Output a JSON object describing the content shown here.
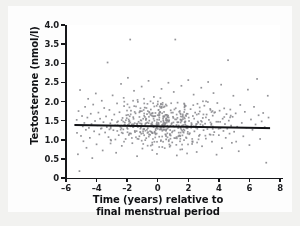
{
  "figure": {
    "background_color": "#f2f2f0",
    "panel_color": "#ffffff"
  },
  "chart_data": {
    "type": "scatter",
    "title": "",
    "xlabel_line1": "Time (years) relative to",
    "xlabel_line2": "final menstrual period",
    "xlabel": "Time (years) relative to final menstrual period",
    "ylabel": "Testosterone (nmol/l)",
    "xlim": [
      -6,
      8
    ],
    "ylim": [
      0,
      4.0
    ],
    "xticks": [
      -6,
      -4,
      -2,
      0,
      2,
      4,
      6,
      8
    ],
    "xticklabels": [
      "–6",
      "–4",
      "–2",
      "0",
      "2",
      "4",
      "6",
      "8"
    ],
    "yticks": [
      0,
      0.5,
      1.0,
      1.5,
      2.0,
      2.5,
      3.0,
      3.5,
      4.0
    ],
    "yticklabels": [
      "0",
      "0.5",
      "1.0",
      "1.5",
      "2.0",
      "2.5",
      "3.0",
      "3.5",
      "4.0"
    ],
    "grid": false,
    "legend": null,
    "marker_color": "#8a8a8e",
    "marker_size_px": 1.7,
    "marker_shape": "square",
    "trendline": {
      "name": "regression line",
      "color": "#121316",
      "width_px": 2.0,
      "x_start": -5.45,
      "y_start": 1.385,
      "x_end": 7.35,
      "y_end": 1.305
    },
    "n_points": 620,
    "series": [
      {
        "name": "Testosterone measurements",
        "x_center": 0.45,
        "x_spread": 2.75,
        "y_center": 1.42,
        "y_spread": 0.47,
        "points": [
          [
            -5.3,
            1.52
          ],
          [
            -5.28,
            1.18
          ],
          [
            -5.22,
            0.62
          ],
          [
            -5.18,
            1.75
          ],
          [
            -5.12,
            0.18
          ],
          [
            -5.08,
            2.3
          ],
          [
            -5.02,
            1.1
          ],
          [
            -4.95,
            1.62
          ],
          [
            -4.9,
            1.35
          ],
          [
            -4.86,
            0.96
          ],
          [
            -4.8,
            1.44
          ],
          [
            -4.75,
            1.86
          ],
          [
            -4.7,
            1.26
          ],
          [
            -4.66,
            0.79
          ],
          [
            -4.6,
            1.58
          ],
          [
            -4.55,
            2.07
          ],
          [
            -4.5,
            1.31
          ],
          [
            -4.44,
            1.05
          ],
          [
            -4.38,
            1.68
          ],
          [
            -4.33,
            1.41
          ],
          [
            -4.28,
            0.52
          ],
          [
            -4.22,
            1.92
          ],
          [
            -4.16,
            1.22
          ],
          [
            -4.1,
            1.49
          ],
          [
            -4.05,
            2.21
          ],
          [
            -4.0,
            0.88
          ],
          [
            -3.94,
            1.37
          ],
          [
            -3.88,
            1.71
          ],
          [
            -3.82,
            1.14
          ],
          [
            -3.77,
            1.55
          ],
          [
            -3.72,
            1.29
          ],
          [
            -3.66,
            2.02
          ],
          [
            -3.6,
            0.72
          ],
          [
            -3.55,
            1.46
          ],
          [
            -3.5,
            1.83
          ],
          [
            -3.44,
            1.19
          ],
          [
            -3.38,
            1.61
          ],
          [
            -3.33,
            1.33
          ],
          [
            -3.28,
            3.02
          ],
          [
            -3.22,
            1.07
          ],
          [
            -3.16,
            1.78
          ],
          [
            -3.1,
            1.43
          ],
          [
            -3.05,
            0.98
          ],
          [
            -3.0,
            1.52
          ],
          [
            -2.95,
            2.16
          ],
          [
            -2.9,
            1.25
          ],
          [
            -2.84,
            1.66
          ],
          [
            -2.78,
            1.38
          ],
          [
            -2.72,
            0.66
          ],
          [
            -2.66,
            1.95
          ],
          [
            -2.6,
            1.48
          ],
          [
            -2.55,
            1.12
          ],
          [
            -2.5,
            1.72
          ],
          [
            -2.45,
            1.34
          ],
          [
            -2.4,
            2.46
          ],
          [
            -2.35,
            0.84
          ],
          [
            -2.3,
            1.57
          ],
          [
            -2.25,
            1.27
          ],
          [
            -2.2,
            1.88
          ],
          [
            -2.15,
            1.45
          ],
          [
            -2.1,
            1.02
          ],
          [
            -2.05,
            1.64
          ],
          [
            -2.0,
            1.31
          ],
          [
            -1.95,
            2.62
          ],
          [
            -1.9,
            1.53
          ],
          [
            -1.85,
            1.16
          ],
          [
            -1.8,
            3.62
          ],
          [
            -1.75,
            1.76
          ],
          [
            -1.7,
            1.4
          ],
          [
            -1.66,
            0.91
          ],
          [
            -1.6,
            1.59
          ],
          [
            -1.55,
            2.28
          ],
          [
            -1.5,
            1.23
          ],
          [
            -1.45,
            1.69
          ],
          [
            -1.4,
            1.36
          ],
          [
            -1.35,
            0.57
          ],
          [
            -1.3,
            1.99
          ],
          [
            -1.25,
            1.47
          ],
          [
            -1.2,
            1.09
          ],
          [
            -1.15,
            1.74
          ],
          [
            -1.1,
            1.32
          ],
          [
            -1.05,
            2.39
          ],
          [
            -1.0,
            0.77
          ],
          [
            -0.95,
            1.55
          ],
          [
            -0.9,
            1.28
          ],
          [
            -0.85,
            1.84
          ],
          [
            -0.8,
            1.42
          ],
          [
            -0.75,
            1.04
          ],
          [
            -0.7,
            1.67
          ],
          [
            -0.65,
            1.3
          ],
          [
            -0.6,
            2.54
          ],
          [
            -0.55,
            1.5
          ],
          [
            -0.5,
            1.13
          ],
          [
            -0.45,
            1.79
          ],
          [
            -0.4,
            1.39
          ],
          [
            -0.35,
            0.87
          ],
          [
            -0.3,
            1.61
          ],
          [
            -0.25,
            2.12
          ],
          [
            -0.2,
            1.21
          ],
          [
            -0.15,
            1.7
          ],
          [
            -0.1,
            1.37
          ],
          [
            -0.05,
            0.63
          ],
          [
            0.0,
            1.93
          ],
          [
            0.05,
            1.44
          ],
          [
            0.1,
            1.08
          ],
          [
            0.15,
            1.73
          ],
          [
            0.2,
            1.33
          ],
          [
            0.25,
            2.33
          ],
          [
            0.3,
            0.81
          ],
          [
            0.35,
            1.56
          ],
          [
            0.4,
            1.26
          ],
          [
            0.45,
            1.87
          ],
          [
            0.5,
            1.43
          ],
          [
            0.55,
            1.01
          ],
          [
            0.6,
            1.65
          ],
          [
            0.65,
            1.29
          ],
          [
            0.7,
            2.49
          ],
          [
            0.75,
            1.51
          ],
          [
            0.8,
            1.15
          ],
          [
            0.85,
            1.77
          ],
          [
            0.9,
            1.41
          ],
          [
            0.95,
            0.93
          ],
          [
            1.0,
            1.6
          ],
          [
            1.05,
            2.25
          ],
          [
            1.1,
            1.24
          ],
          [
            1.15,
            3.62
          ],
          [
            1.2,
            1.35
          ],
          [
            1.25,
            0.59
          ],
          [
            1.3,
            1.97
          ],
          [
            1.35,
            1.46
          ],
          [
            1.4,
            1.11
          ],
          [
            1.45,
            1.75
          ],
          [
            1.5,
            1.31
          ],
          [
            1.55,
            2.41
          ],
          [
            1.6,
            0.75
          ],
          [
            1.65,
            1.54
          ],
          [
            1.7,
            1.27
          ],
          [
            1.75,
            1.85
          ],
          [
            1.8,
            1.4
          ],
          [
            1.85,
            1.06
          ],
          [
            1.9,
            1.68
          ],
          [
            1.95,
            1.3
          ],
          [
            2.0,
            2.56
          ],
          [
            2.05,
            1.49
          ],
          [
            2.1,
            1.17
          ],
          [
            2.15,
            1.8
          ],
          [
            2.2,
            1.38
          ],
          [
            2.25,
            0.89
          ],
          [
            2.3,
            1.62
          ],
          [
            2.35,
            2.18
          ],
          [
            2.4,
            1.22
          ],
          [
            2.45,
            1.71
          ],
          [
            2.5,
            1.36
          ],
          [
            2.55,
            0.68
          ],
          [
            2.6,
            1.94
          ],
          [
            2.65,
            1.45
          ],
          [
            2.7,
            1.1
          ],
          [
            2.75,
            1.74
          ],
          [
            2.8,
            1.34
          ],
          [
            2.85,
            2.36
          ],
          [
            2.9,
            0.83
          ],
          [
            2.95,
            1.57
          ],
          [
            3.0,
            1.25
          ],
          [
            3.05,
            1.89
          ],
          [
            3.1,
            1.42
          ],
          [
            3.15,
            1.03
          ],
          [
            3.2,
            1.66
          ],
          [
            3.25,
            1.28
          ],
          [
            3.3,
            2.51
          ],
          [
            3.35,
            1.52
          ],
          [
            3.4,
            1.14
          ],
          [
            3.45,
            1.78
          ],
          [
            3.5,
            1.39
          ],
          [
            3.55,
            0.95
          ],
          [
            3.6,
            1.63
          ],
          [
            3.65,
            2.22
          ],
          [
            3.7,
            1.2
          ],
          [
            3.75,
            1.72
          ],
          [
            3.8,
            1.32
          ],
          [
            3.85,
            0.61
          ],
          [
            3.9,
            1.96
          ],
          [
            3.95,
            1.47
          ],
          [
            4.0,
            1.12
          ],
          [
            4.05,
            1.76
          ],
          [
            4.1,
            1.3
          ],
          [
            4.15,
            2.44
          ],
          [
            4.2,
            0.78
          ],
          [
            4.25,
            1.55
          ],
          [
            4.3,
            1.23
          ],
          [
            4.35,
            1.82
          ],
          [
            4.4,
            1.41
          ],
          [
            4.45,
            1.05
          ],
          [
            4.5,
            1.67
          ],
          [
            4.55,
            1.29
          ],
          [
            4.6,
            3.08
          ],
          [
            4.65,
            1.5
          ],
          [
            4.7,
            1.16
          ],
          [
            4.75,
            1.79
          ],
          [
            4.8,
            1.37
          ],
          [
            4.85,
            0.92
          ],
          [
            4.9,
            1.6
          ],
          [
            4.95,
            2.15
          ],
          [
            5.0,
            1.21
          ],
          [
            5.1,
            1.69
          ],
          [
            5.2,
            1.34
          ],
          [
            5.3,
            0.7
          ],
          [
            5.4,
            1.91
          ],
          [
            5.5,
            1.44
          ],
          [
            5.6,
            1.09
          ],
          [
            5.7,
            1.73
          ],
          [
            5.8,
            1.31
          ],
          [
            5.9,
            2.31
          ],
          [
            6.0,
            0.86
          ],
          [
            6.1,
            1.53
          ],
          [
            6.2,
            1.26
          ],
          [
            6.3,
            1.86
          ],
          [
            6.4,
            1.4
          ],
          [
            6.5,
            2.59
          ],
          [
            6.6,
            1.64
          ],
          [
            6.7,
            1.02
          ],
          [
            6.8,
            1.48
          ],
          [
            6.9,
            1.7
          ],
          [
            7.0,
            1.33
          ],
          [
            7.1,
            0.4
          ],
          [
            7.2,
            2.15
          ],
          [
            7.25,
            1.58
          ]
        ]
      }
    ]
  }
}
